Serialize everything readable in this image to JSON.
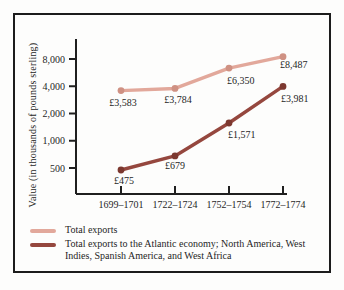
{
  "chart_data": {
    "type": "line",
    "yscale": "log",
    "ylabel": "Value (in thousands of pounds sterling)",
    "categories": [
      "1699–1701",
      "1722–1724",
      "1752–1754",
      "1772–1774"
    ],
    "yticks": [
      {
        "value": 8000,
        "label": "8,000"
      },
      {
        "value": 4000,
        "label": "4,000"
      },
      {
        "value": 2000,
        "label": "2,000"
      },
      {
        "value": 1000,
        "label": "1,000"
      },
      {
        "value": 500,
        "label": "500"
      }
    ],
    "ylim": [
      400,
      10000
    ],
    "grid": "off",
    "legend_position": "bottom-left",
    "series": [
      {
        "name": "Total exports",
        "color": "#e2a89b",
        "marker_color": "#cf9183",
        "values": [
          3583,
          3784,
          6350,
          8487
        ],
        "point_labels": [
          "£3,583",
          "£3,784",
          "£6,350",
          "£8,487"
        ],
        "label_placement": [
          {
            "dx": 2,
            "dy": 15,
            "anchor": "middle"
          },
          {
            "dx": 3,
            "dy": 15,
            "anchor": "middle"
          },
          {
            "dx": -2,
            "dy": 16,
            "anchor": "start"
          },
          {
            "dx": -3,
            "dy": 11,
            "anchor": "start"
          }
        ]
      },
      {
        "name": "Total exports to the Atlantic economy; North America, West Indies, Spanish America, and West Africa",
        "color": "#95473e",
        "marker_color": "#7c382f",
        "values": [
          475,
          679,
          1571,
          3981
        ],
        "point_labels": [
          "£475",
          "£679",
          "£1,571",
          "£3,981"
        ],
        "label_placement": [
          {
            "dx": 3,
            "dy": 14,
            "anchor": "middle"
          },
          {
            "dx": 0,
            "dy": 13,
            "anchor": "middle"
          },
          {
            "dx": -1,
            "dy": 15,
            "anchor": "start"
          },
          {
            "dx": -2,
            "dy": 16,
            "anchor": "start"
          }
        ]
      }
    ]
  }
}
